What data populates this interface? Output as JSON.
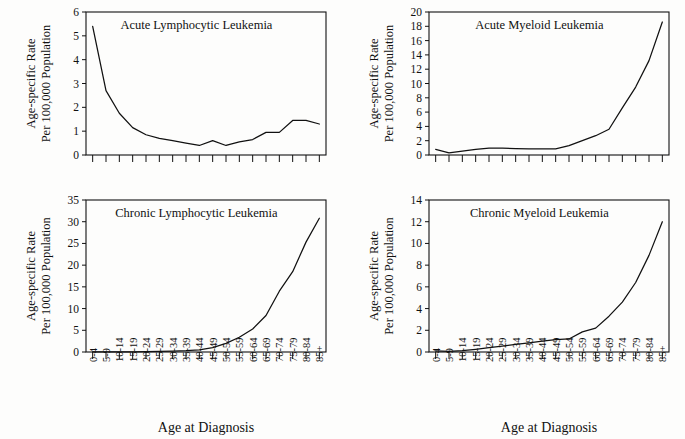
{
  "figure": {
    "shared_xlabel": "Age at Diagnosis",
    "shared_ylabel_line1": "Age-specific Rate",
    "shared_ylabel_line2": "Per 100,000 Population",
    "categories": [
      "0-4",
      "5-9",
      "10-14",
      "15-19",
      "20-24",
      "25-29",
      "30-34",
      "35-39",
      "40-44",
      "45-49",
      "50-54",
      "55-59",
      "60-64",
      "65-69",
      "70-74",
      "75-79",
      "80-84",
      "85+"
    ],
    "line_color": "#111111",
    "background_color": "#fdfdfc"
  },
  "chart_data": [
    {
      "type": "line",
      "title": "Acute Lymphocytic Leukemia",
      "xlabel": "Age at Diagnosis",
      "ylabel": "Age-specific Rate Per 100,000 Population",
      "categories": [
        "0-4",
        "5-9",
        "10-14",
        "15-19",
        "20-24",
        "25-29",
        "30-34",
        "35-39",
        "40-44",
        "45-49",
        "50-54",
        "55-59",
        "60-64",
        "65-69",
        "70-74",
        "75-79",
        "80-84",
        "85+"
      ],
      "values": [
        5.4,
        2.7,
        1.75,
        1.15,
        0.85,
        0.7,
        0.6,
        0.5,
        0.4,
        0.6,
        0.4,
        0.55,
        0.65,
        0.95,
        0.95,
        1.45,
        1.45,
        1.3,
        2.3
      ],
      "ylim": [
        0,
        6
      ],
      "ytick_step": 1,
      "yticks": [
        0,
        1,
        2,
        3,
        4,
        5,
        6
      ],
      "grid": false,
      "legend": "none",
      "xtick_labels_visible": false
    },
    {
      "type": "line",
      "title": "Acute Myeloid Leukemia",
      "xlabel": "Age at Diagnosis",
      "ylabel": "Age-specific Rate Per 100,000 Population",
      "categories": [
        "0-4",
        "5-9",
        "10-14",
        "15-19",
        "20-24",
        "25-29",
        "30-34",
        "35-39",
        "40-44",
        "45-49",
        "50-54",
        "55-59",
        "60-64",
        "65-69",
        "70-74",
        "75-79",
        "80-84",
        "85+"
      ],
      "values": [
        0.8,
        0.3,
        0.55,
        0.8,
        0.95,
        0.95,
        0.9,
        0.85,
        0.85,
        0.85,
        1.3,
        2.0,
        2.7,
        3.6,
        6.6,
        9.5,
        13.2,
        18.6,
        18.8
      ],
      "ylim": [
        0,
        20
      ],
      "ytick_step": 2,
      "yticks": [
        0,
        2,
        4,
        6,
        8,
        10,
        12,
        14,
        16,
        18,
        20
      ],
      "grid": false,
      "legend": "none",
      "xtick_labels_visible": false
    },
    {
      "type": "line",
      "title": "Chronic Lymphocytic Leukemia",
      "xlabel": "Age at Diagnosis",
      "ylabel": "Age-specific Rate Per 100,000 Population",
      "categories": [
        "0-4",
        "5-9",
        "10-14",
        "15-19",
        "20-24",
        "25-29",
        "30-34",
        "35-39",
        "40-44",
        "45-49",
        "50-54",
        "55-59",
        "60-64",
        "65-69",
        "70-74",
        "75-79",
        "80-84",
        "85+"
      ],
      "values": [
        0.05,
        0.05,
        0.05,
        0.05,
        0.1,
        0.15,
        0.2,
        0.3,
        0.5,
        1.0,
        2.0,
        3.4,
        5.3,
        8.4,
        14.0,
        18.5,
        25.3,
        30.8
      ],
      "ylim": [
        0,
        35
      ],
      "ytick_step": 5,
      "yticks": [
        0,
        5,
        10,
        15,
        20,
        25,
        30,
        35
      ],
      "grid": false,
      "legend": "none",
      "xtick_labels_visible": true
    },
    {
      "type": "line",
      "title": "Chronic Myeloid Leukemia",
      "xlabel": "Age at Diagnosis",
      "ylabel": "Age-specific Rate Per 100,000 Population",
      "categories": [
        "0-4",
        "5-9",
        "10-14",
        "15-19",
        "20-24",
        "25-29",
        "30-34",
        "35-39",
        "40-44",
        "45-49",
        "50-54",
        "55-59",
        "60-64",
        "65-69",
        "70-74",
        "75-79",
        "80-84",
        "85+"
      ],
      "values": [
        0.1,
        0.05,
        0.12,
        0.25,
        0.4,
        0.55,
        0.7,
        0.85,
        1.0,
        1.15,
        1.2,
        1.85,
        2.2,
        3.3,
        4.6,
        6.4,
        8.9,
        12.0
      ],
      "ylim": [
        0,
        14
      ],
      "ytick_step": 2,
      "yticks": [
        0,
        2,
        4,
        6,
        8,
        10,
        12,
        14
      ],
      "grid": false,
      "legend": "none",
      "xtick_labels_visible": true
    }
  ]
}
